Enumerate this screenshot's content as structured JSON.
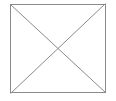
{
  "canvas": {
    "width": 116,
    "height": 101,
    "background_color": "#ffffff",
    "description": "Missing image placeholder: a square outline crossed by two diagonals forming an X"
  },
  "graphic": {
    "name": "broken-image-placeholder",
    "stroke_color": "#8a8a8a",
    "fill_color": "#ffffff",
    "stroke_width": 1,
    "frame": {
      "x": 10,
      "y": 4,
      "width": 96,
      "height": 89
    },
    "diagonals": [
      {
        "label": "diagonal-top-left-to-bottom-right",
        "x1": 10,
        "y1": 4,
        "x2": 106,
        "y2": 93
      },
      {
        "label": "diagonal-bottom-left-to-top-right",
        "x1": 10,
        "y1": 93,
        "x2": 106,
        "y2": 4
      }
    ],
    "alt_text": "Image placeholder"
  }
}
